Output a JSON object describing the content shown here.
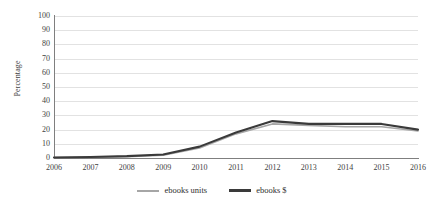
{
  "chart_data": {
    "type": "line",
    "title": "",
    "xlabel": "",
    "ylabel": "Percentage",
    "categories": [
      "2006",
      "2007",
      "2008",
      "2009",
      "2010",
      "2011",
      "2012",
      "2013",
      "2014",
      "2015",
      "2016"
    ],
    "x": [
      2006,
      2007,
      2008,
      2009,
      2010,
      2011,
      2012,
      2013,
      2014,
      2015,
      2016
    ],
    "ylim": [
      0,
      100
    ],
    "yticks": [
      0,
      10,
      20,
      30,
      40,
      50,
      60,
      70,
      80,
      90,
      100
    ],
    "grid": true,
    "legend_position": "bottom",
    "series": [
      {
        "name": "ebooks units",
        "color": "#a6a6a6",
        "values": [
          0.3,
          0.5,
          1,
          2,
          7,
          17,
          24,
          23,
          22,
          22,
          19
        ]
      },
      {
        "name": "ebooks $",
        "color": "#3a3a3a",
        "values": [
          0.4,
          0.7,
          1.3,
          2.5,
          8,
          18,
          26,
          24,
          24,
          24,
          20
        ]
      }
    ]
  },
  "axes": {
    "y_title": "Percentage",
    "y_tick_labels": [
      "100",
      "90",
      "80",
      "70",
      "60",
      "50",
      "40",
      "30",
      "20",
      "10",
      "0"
    ],
    "x_tick_labels": [
      "2006",
      "2007",
      "2008",
      "2009",
      "2010",
      "2011",
      "2012",
      "2013",
      "2014",
      "2015",
      "2016"
    ]
  },
  "legend": {
    "items": [
      {
        "label": "ebooks units",
        "color": "#a6a6a6"
      },
      {
        "label": "ebooks $",
        "color": "#3a3a3a"
      }
    ]
  },
  "colors": {
    "axis": "#7f7f7f",
    "grid": "#e2e2e2",
    "text": "#3f3f3f",
    "series_units": "#a6a6a6",
    "series_dollars": "#3a3a3a",
    "background": "#ffffff"
  }
}
